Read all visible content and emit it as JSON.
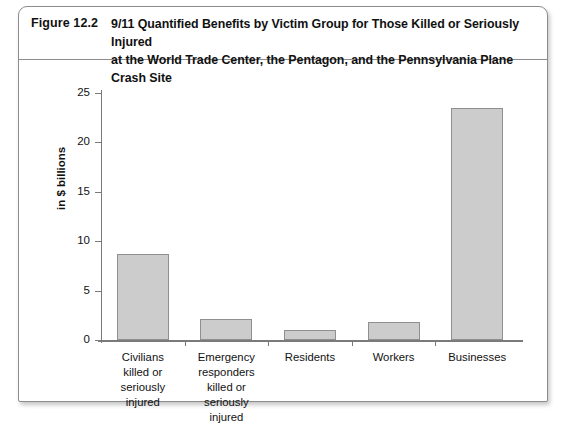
{
  "figure": {
    "number": "Figure 12.2",
    "title_line1": "9/11 Quantified Benefits by Victim Group for Those Killed or Seriously Injured",
    "title_line2": "at the World Trade Center, the Pentagon, and the Pennsylvania Plane Crash Site"
  },
  "page": {
    "footer_text": "                                                                                                                           "
  },
  "colors": {
    "bar_fill": "#cccccc",
    "bar_stroke": "#8f8f8f",
    "axis": "#7a7a7a",
    "frame": "#8c8c8c",
    "text": "#111111"
  },
  "chart_data": {
    "type": "bar",
    "title": "9/11 Quantified Benefits by Victim Group for Those Killed or Seriously Injured at the World Trade Center, the Pentagon, and the Pennsylvania Plane Crash Site",
    "xlabel": "",
    "ylabel": "in $ billions",
    "ylim": [
      0,
      25
    ],
    "yticks": [
      0,
      5,
      10,
      15,
      20,
      25
    ],
    "ytick_labels": [
      "0",
      "5",
      "10",
      "15",
      "20",
      "25"
    ],
    "grid": false,
    "legend": "none",
    "categories": [
      "Civilians killed or seriously injured",
      "Emergency responders killed or seriously injured",
      "Residents",
      "Workers",
      "Businesses"
    ],
    "category_label_lines": [
      [
        "Civilians",
        "killed or",
        "seriously",
        "injured"
      ],
      [
        "Emergency",
        "responders",
        "killed or",
        "seriously",
        "injured"
      ],
      [
        "Residents"
      ],
      [
        "Workers"
      ],
      [
        "Businesses"
      ]
    ],
    "values": [
      8.7,
      2.1,
      1.0,
      1.8,
      23.5
    ]
  }
}
